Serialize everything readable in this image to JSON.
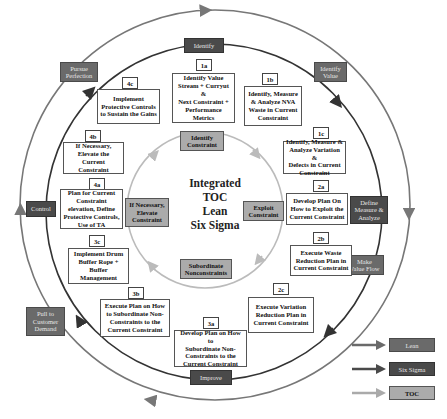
{
  "center": {
    "lines": [
      "Integrated",
      "TOC",
      "Lean",
      "Six Sigma"
    ]
  },
  "colors": {
    "lean": "#6a6a6a",
    "six_sigma": "#4a4a4a",
    "toc": "#ababab",
    "outer_ring": "#777777",
    "inner_ring": "#333333",
    "toc_ring": "#bbbbbb"
  },
  "outer_ring_phases": {
    "identify_value": "Identify\nValue",
    "make_value_flow": "Make\nValue Flow",
    "pull_to_customer_demand": "Pull to\nCustomer\nDemand",
    "pursue_perfection": "Pursue\nPerfection"
  },
  "inner_ring_phases": {
    "identify": "Identify",
    "define_measure_analyze": "Define\nMeasure &\nAnalyze",
    "improve": "Improve",
    "control": "Control"
  },
  "toc_steps": {
    "identify_constraint": "Identify\nConstraint",
    "exploit_constraint": "Exploit\nConstraint",
    "subordinate": "Subordinate\nNonconstraints",
    "elevate": "If Necessary,\nElevate\nConstraint"
  },
  "steps": [
    {
      "id": "1a",
      "text": "Identify Value\nStream + Curryut &\nNext Constraint +\nPerformance\nMetrics"
    },
    {
      "id": "1b",
      "text": "Identify, Measure\n& Analyze NVA\nWaste in Current\nConstraint"
    },
    {
      "id": "1c",
      "text": "Identify, Measure &\nAnalyze Variation &\nDefects in Current\nConstraint"
    },
    {
      "id": "2a",
      "text": "Develop Plan On\nHow to Exploit the\nCurrent Constraint"
    },
    {
      "id": "2b",
      "text": "Execute Waste\nReduction Plan in\nCurrent Constraint"
    },
    {
      "id": "2c",
      "text": "Execute Variation\nReduction Plan in\nCurrent Constraint"
    },
    {
      "id": "3a",
      "text": "Develop Plan on How to\nSubordinate Non-\nConstraints to the\nCurrent Constraint"
    },
    {
      "id": "3b",
      "text": "Execute Plan on How\nto Subordinate Non-\nConstraints to the\nCurrent Constraint"
    },
    {
      "id": "3c",
      "text": "Implement Drum\nBuffer Rope +\nBuffer Management"
    },
    {
      "id": "4a",
      "text": "Plan for Current\nConstraint\nelevation, Define\nProtective Controls,\nUse of TA"
    },
    {
      "id": "4b",
      "text": "If Necessary,\nElevate the Current\nConstraint"
    },
    {
      "id": "4c",
      "text": "Implement\nProtective Controls\nto Sustain the Gains"
    }
  ],
  "legend": [
    {
      "label": "Lean"
    },
    {
      "label": "Six Sigma"
    },
    {
      "label": "TOC"
    }
  ]
}
